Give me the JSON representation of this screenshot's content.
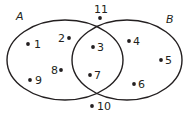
{
  "diagram": {
    "type": "venn",
    "stroke_color": "#231f20",
    "sets": [
      {
        "name": "A",
        "label": "A",
        "elements": [
          "1",
          "2",
          "3",
          "7",
          "8",
          "9"
        ]
      },
      {
        "name": "B",
        "label": "B",
        "elements": [
          "3",
          "4",
          "5",
          "6",
          "7"
        ]
      }
    ],
    "intersection": [
      "3",
      "7"
    ],
    "outside": [
      "10",
      "11"
    ],
    "points": [
      {
        "label": "1",
        "dot": [
          28,
          44
        ],
        "text": [
          34,
          48
        ]
      },
      {
        "label": "2",
        "dot": [
          69,
          38
        ],
        "text": [
          58,
          42
        ]
      },
      {
        "label": "3",
        "dot": [
          93,
          47
        ],
        "text": [
          97,
          51
        ]
      },
      {
        "label": "4",
        "dot": [
          129,
          41
        ],
        "text": [
          133,
          45
        ]
      },
      {
        "label": "5",
        "dot": [
          161,
          60
        ],
        "text": [
          165,
          64
        ]
      },
      {
        "label": "6",
        "dot": [
          134,
          84
        ],
        "text": [
          138,
          88
        ]
      },
      {
        "label": "7",
        "dot": [
          90,
          75
        ],
        "text": [
          94,
          79
        ]
      },
      {
        "label": "8",
        "dot": [
          61,
          70
        ],
        "text": [
          51,
          74
        ]
      },
      {
        "label": "9",
        "dot": [
          30,
          80
        ],
        "text": [
          35,
          84
        ]
      },
      {
        "label": "10",
        "dot": [
          92,
          106
        ],
        "text": [
          97,
          110
        ]
      },
      {
        "label": "11",
        "dot": [
          100,
          18
        ],
        "text": [
          94,
          13
        ]
      }
    ]
  }
}
